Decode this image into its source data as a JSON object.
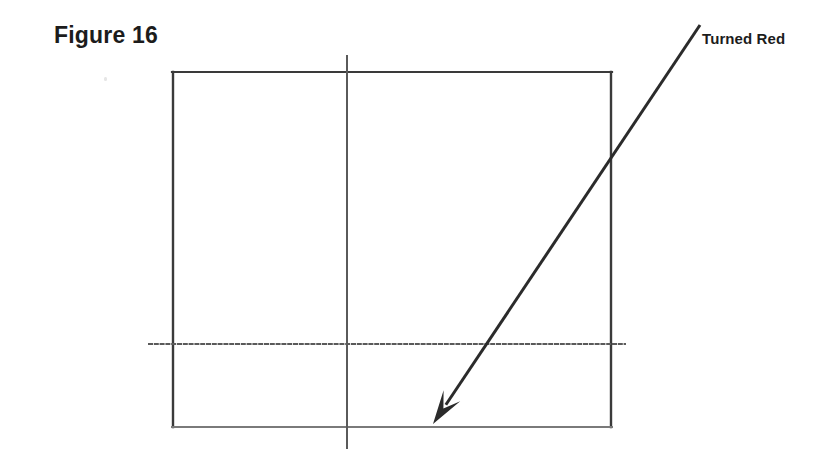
{
  "figure": {
    "caption": "Figure 16",
    "background_color": "#ffffff",
    "ink_color": "#2b2b2b",
    "light_ink_color": "#6e6e6e",
    "width": 839,
    "height": 464
  },
  "annotation": {
    "label": "Turned Red",
    "label_x": 702,
    "label_y": 31,
    "arrow": {
      "tail_x": 700,
      "tail_y": 25,
      "tip_x": 433,
      "tip_y": 424,
      "line_width": 3,
      "head_length": 34,
      "head_width": 20,
      "color": "#2b2b2b"
    }
  },
  "diagram": {
    "rectangle": {
      "left": 172,
      "top": 72,
      "right": 612,
      "bottom": 427,
      "stroke_width": 2,
      "stroke_color": "#3a3a3a",
      "bottom_stroke_color": "#7a7a7a"
    },
    "vertical_guide": {
      "x": 347,
      "y_start": 55,
      "y_end": 449,
      "stroke_width": 2,
      "stroke_color": "#5a5a5a"
    },
    "horizontal_guide": {
      "y": 344,
      "x_start": 148,
      "x_end": 626,
      "stroke_width": 2,
      "stroke_color": "#5a5a5a"
    }
  },
  "artifacts": [
    {
      "x": 104,
      "y": 77
    }
  ]
}
